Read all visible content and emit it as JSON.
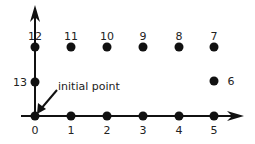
{
  "diagram": {
    "annotation": "initial point",
    "points": [
      {
        "label": "0",
        "x": 35,
        "y": 116,
        "lx": 35,
        "ly": 134
      },
      {
        "label": "1",
        "x": 71,
        "y": 116,
        "lx": 71,
        "ly": 134
      },
      {
        "label": "2",
        "x": 107,
        "y": 116,
        "lx": 107,
        "ly": 134
      },
      {
        "label": "3",
        "x": 143,
        "y": 116,
        "lx": 143,
        "ly": 134
      },
      {
        "label": "4",
        "x": 179,
        "y": 116,
        "lx": 179,
        "ly": 134
      },
      {
        "label": "5",
        "x": 214,
        "y": 116,
        "lx": 214,
        "ly": 134
      },
      {
        "label": "6",
        "x": 214,
        "y": 81,
        "lx": 231,
        "ly": 85
      },
      {
        "label": "7",
        "x": 214,
        "y": 47,
        "lx": 214,
        "ly": 40
      },
      {
        "label": "8",
        "x": 179,
        "y": 47,
        "lx": 179,
        "ly": 40
      },
      {
        "label": "9",
        "x": 143,
        "y": 47,
        "lx": 143,
        "ly": 40
      },
      {
        "label": "10",
        "x": 107,
        "y": 47,
        "lx": 107,
        "ly": 40
      },
      {
        "label": "11",
        "x": 71,
        "y": 47,
        "lx": 71,
        "ly": 40
      },
      {
        "label": "12",
        "x": 35,
        "y": 47,
        "lx": 35,
        "ly": 40
      },
      {
        "label": "13",
        "x": 35,
        "y": 82,
        "lx": 20,
        "ly": 86
      }
    ]
  }
}
